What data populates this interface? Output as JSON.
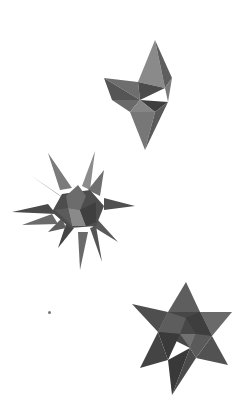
{
  "image": {
    "background": "#ffffff",
    "description": "Three paper stellated polyhedron models on a white background",
    "objects": [
      {
        "name": "small-stellated-octahedron-top",
        "position": "upper right",
        "color": "#5f5f5f"
      },
      {
        "name": "great-stellated-star-middle",
        "position": "middle left",
        "color": "#5a5a5a"
      },
      {
        "name": "stella-octangula-bottom",
        "position": "lower right",
        "color": "#4e4e4e"
      }
    ]
  }
}
